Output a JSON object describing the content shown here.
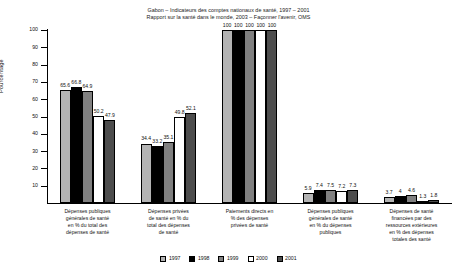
{
  "chart_data": {
    "type": "bar",
    "title": "Gabon – Indicateurs des comptes nationaux de santé, 1997 – 2001",
    "subtitle": "Rapport sur la santé dans le monde, 2003 – Façonner l'avenir, OMS",
    "xlabel": "",
    "ylabel": "Pourcentage",
    "ylim": [
      0,
      100
    ],
    "ytick_labels": [
      "100",
      "90",
      "80",
      "70",
      "60",
      "50",
      "40",
      "30",
      "20",
      "10"
    ],
    "ytick_values": [
      100,
      90,
      80,
      70,
      60,
      50,
      40,
      30,
      20,
      10
    ],
    "grid": false,
    "legend_position": "bottom",
    "categories": [
      "Dépenses publiques générales de santé en % du total des dépenses de santé",
      "Dépenses privées de santé en % du total des dépenses de santé",
      "Paiements directs en % des dépenses privées de santé",
      "Dépenses publiques générales de santé en % du dépenses publiques",
      "Dépenses de santé financées par des ressources extérieures en % des dépenses totales des santé"
    ],
    "category_lines": [
      [
        "Dépenses publiques",
        "générales de santé",
        "en % du total des",
        "dépenses de santé"
      ],
      [
        "Dépenses privées",
        "de santé en % du",
        "total des dépenses",
        "de santé"
      ],
      [
        "Paiements directs en",
        "% des dépenses",
        "privées de santé"
      ],
      [
        "Dépenses publiques",
        "générales de santé",
        "en % du dépenses",
        "publiques"
      ],
      [
        "Dépenses de santé",
        "financées par des",
        "ressources extérieures",
        "en % des dépenses",
        "totales des santé"
      ]
    ],
    "series": [
      {
        "name": "1997",
        "color": "#b3b3b3",
        "values": [
          65.6,
          34.4,
          100,
          5.9,
          3.7
        ]
      },
      {
        "name": "1998",
        "color": "#000000",
        "values": [
          66.8,
          33.2,
          100,
          7.4,
          4.0
        ]
      },
      {
        "name": "1999",
        "color": "#808080",
        "values": [
          64.9,
          35.1,
          100,
          7.5,
          4.6
        ]
      },
      {
        "name": "2000",
        "color": "#ffffff",
        "values": [
          50.2,
          49.8,
          100,
          7.2,
          1.3
        ]
      },
      {
        "name": "2001",
        "color": "#4d4d4d",
        "values": [
          47.9,
          52.1,
          100,
          7.3,
          1.8
        ]
      }
    ],
    "value_labels": [
      [
        "65.6",
        "66.8",
        "64.9",
        "50.2",
        "47.9"
      ],
      [
        "34.4",
        "33.2",
        "35.1",
        "49.8",
        "52.1"
      ],
      [
        "100",
        "100",
        "100",
        "100",
        "100"
      ],
      [
        "5.9",
        "7.4",
        "7.5",
        "7.2",
        "7.3"
      ],
      [
        "3.7",
        "4",
        "4.6",
        "1.3",
        "1.8"
      ]
    ]
  },
  "legend": {
    "items": [
      {
        "label": "1997",
        "color": "#b3b3b3"
      },
      {
        "label": "1998",
        "color": "#000000"
      },
      {
        "label": "1999",
        "color": "#808080"
      },
      {
        "label": "2000",
        "color": "#ffffff"
      },
      {
        "label": "2001",
        "color": "#4d4d4d"
      }
    ]
  }
}
